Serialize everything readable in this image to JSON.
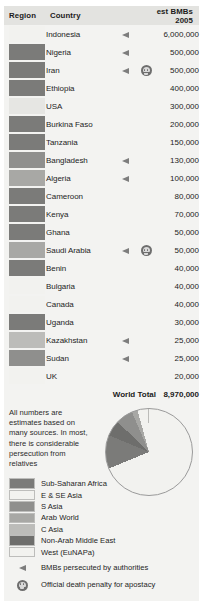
{
  "table": {
    "headers": {
      "region": "Region",
      "country": "Country",
      "value": "est BMBs 2005"
    },
    "rows": [
      {
        "country": "Indonesia",
        "value": "6,000,000",
        "region_color": "#f2f2ef",
        "persecuted": true,
        "death_penalty": false
      },
      {
        "country": "Nigeria",
        "value": "500,000",
        "region_color": "#7b7b79",
        "persecuted": true,
        "death_penalty": false
      },
      {
        "country": "Iran",
        "value": "500,000",
        "region_color": "#7b7b79",
        "persecuted": true,
        "death_penalty": true
      },
      {
        "country": "Ethiopia",
        "value": "400,000",
        "region_color": "#7b7b79",
        "persecuted": false,
        "death_penalty": false
      },
      {
        "country": "USA",
        "value": "300,000",
        "region_color": "#e6e6e3",
        "persecuted": false,
        "death_penalty": false
      },
      {
        "country": "Burkina Faso",
        "value": "200,000",
        "region_color": "#7b7b79",
        "persecuted": false,
        "death_penalty": false
      },
      {
        "country": "Tanzania",
        "value": "150,000",
        "region_color": "#7b7b79",
        "persecuted": false,
        "death_penalty": false
      },
      {
        "country": "Bangladesh",
        "value": "130,000",
        "region_color": "#8f8f8d",
        "persecuted": true,
        "death_penalty": false
      },
      {
        "country": "Algeria",
        "value": "100,000",
        "region_color": "#a8a8a5",
        "persecuted": true,
        "death_penalty": false
      },
      {
        "country": "Cameroon",
        "value": "80,000",
        "region_color": "#7b7b79",
        "persecuted": false,
        "death_penalty": false
      },
      {
        "country": "Kenya",
        "value": "70,000",
        "region_color": "#7b7b79",
        "persecuted": false,
        "death_penalty": false
      },
      {
        "country": "Ghana",
        "value": "50,000",
        "region_color": "#7b7b79",
        "persecuted": false,
        "death_penalty": false
      },
      {
        "country": "Saudi Arabia",
        "value": "50,000",
        "region_color": "#a8a8a5",
        "persecuted": true,
        "death_penalty": true
      },
      {
        "country": "Benin",
        "value": "40,000",
        "region_color": "#7b7b79",
        "persecuted": false,
        "death_penalty": false
      },
      {
        "country": "Bulgaria",
        "value": "40,000",
        "region_color": "#f2f2ef",
        "persecuted": false,
        "death_penalty": false
      },
      {
        "country": "Canada",
        "value": "40,000",
        "region_color": "#f2f2ef",
        "persecuted": false,
        "death_penalty": false
      },
      {
        "country": "Uganda",
        "value": "30,000",
        "region_color": "#7b7b79",
        "persecuted": false,
        "death_penalty": false
      },
      {
        "country": "Kazakhstan",
        "value": "25,000",
        "region_color": "#bcbcb9",
        "persecuted": true,
        "death_penalty": false
      },
      {
        "country": "Sudan",
        "value": "25,000",
        "region_color": "#8f8f8d",
        "persecuted": true,
        "death_penalty": false
      },
      {
        "country": "UK",
        "value": "20,000",
        "region_color": "#f2f2ef",
        "persecuted": false,
        "death_penalty": false
      }
    ],
    "total_label": "World Total",
    "total_value": "8,970,000"
  },
  "note": "All numbers are estimates based on many sources. In most, there is considerable persecution from relatives",
  "legend": {
    "swatches": [
      {
        "label": "Sub-Saharan Africa",
        "color": "#7b7b79"
      },
      {
        "label": "E & SE Asia",
        "color": "#f2f2ef"
      },
      {
        "label": "S Asia",
        "color": "#8f8f8d"
      },
      {
        "label": "Arab World",
        "color": "#a8a8a5"
      },
      {
        "label": "C Asia",
        "color": "#bcbcb9"
      },
      {
        "label": "Non-Arab Middle East",
        "color": "#6e6e6c"
      },
      {
        "label": "West (EuNAPa)",
        "color": "#f2f2ef"
      }
    ],
    "persecuted_label": "BMBs persecuted by authorities",
    "death_penalty_label": "Official death penalty for apostacy"
  },
  "chart_data": {
    "type": "pie",
    "title": "",
    "legend_position": "left",
    "labels": [
      "E & SE Asia",
      "Sub-Saharan Africa",
      "Non-Arab Middle East",
      "S Asia",
      "Arab World",
      "West (EuNAPa)",
      "C Asia"
    ],
    "values": [
      6170000,
      1120000,
      525000,
      580000,
      190000,
      360000,
      25000
    ],
    "percentages": [
      68.8,
      12.5,
      5.9,
      6.5,
      2.1,
      4.0,
      0.3
    ],
    "colors": [
      "#f2f2ef",
      "#7b7b79",
      "#6e6e6c",
      "#8f8f8d",
      "#a8a8a5",
      "#f2f2ef",
      "#bcbcb9"
    ]
  }
}
